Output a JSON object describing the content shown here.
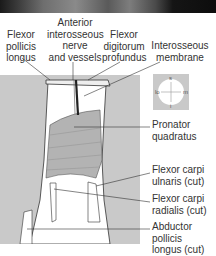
{
  "figure": {
    "photo_strip": "grayscale photograph (cropped top)",
    "labels_top": [
      {
        "id": "flexor-pollicis-longus",
        "text": "Flexor\npollicis\nlongus"
      },
      {
        "id": "anterior-interosseous",
        "text": "Anterior\ninterosseous\nnerve\nand vessels"
      },
      {
        "id": "flexor-digitorum-profundus",
        "text": "Flexor\ndigitorum\nprofundus"
      },
      {
        "id": "interosseous-membrane",
        "text": "Interosseous\nmembrane"
      }
    ],
    "labels_right": [
      {
        "id": "pronator-quadratus",
        "text": "Pronator\nquadratus"
      },
      {
        "id": "flexor-carpi-ulnaris",
        "text": "Flexor carpi\nulnaris (cut)"
      },
      {
        "id": "flexor-carpi-radialis",
        "text": "Flexor carpi\nradialis (cut)"
      },
      {
        "id": "abductor-pollicis-longus",
        "text": "Abductor pollicis\nlongus (cut)"
      }
    ],
    "compass": {
      "top": "s",
      "bottom": "i",
      "left": "lo",
      "right": "m"
    },
    "colors": {
      "panel": "#c9c9c9",
      "muscle": "#b3b3b3",
      "line": "#333333"
    }
  }
}
